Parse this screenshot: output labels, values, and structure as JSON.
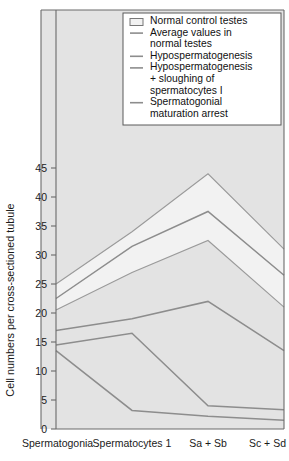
{
  "chart_data": {
    "type": "line",
    "title": "",
    "xlabel": "",
    "ylabel": "Cell numbers per cross-sectioned tubule",
    "categories": [
      "Spermatogonia",
      "Spermatocytes 1",
      "Sa + Sb",
      "Sc + Sd"
    ],
    "ylim": [
      0,
      48
    ],
    "yticks": [
      0,
      5,
      10,
      15,
      20,
      25,
      30,
      35,
      40,
      45
    ],
    "ytick_labels": [
      "0",
      "5",
      "10",
      "15",
      "20",
      "25",
      "30",
      "35",
      "40",
      "45"
    ],
    "grid": false,
    "legend_position": "top-right",
    "band": {
      "name": "Normal control testes",
      "upper": [
        25.0,
        34.0,
        44.0,
        31.0
      ],
      "lower": [
        20.5,
        27.0,
        32.5,
        21.0
      ],
      "fill_color": "#f2f2f2",
      "edge_color": "#9a9a9a"
    },
    "series": [
      {
        "name": "Average values in normal testes",
        "values": [
          22.5,
          31.5,
          37.5,
          26.5
        ],
        "color": "#8d8d8d"
      },
      {
        "name": "Hypospermatogenesis",
        "values": [
          17.0,
          19.0,
          22.0,
          13.5
        ],
        "color": "#8d8d8d"
      },
      {
        "name": "Hypospermatogenesis + sloughing of spermatocytes I",
        "values": [
          14.5,
          16.5,
          4.0,
          3.3
        ],
        "color": "#8d8d8d"
      },
      {
        "name": "Spermatogonial maturation arrest",
        "values": [
          13.5,
          3.2,
          2.2,
          1.5
        ],
        "color": "#8d8d8d"
      }
    ]
  },
  "legend": {
    "entries": [
      {
        "label": "Normal control testes",
        "marker": "swatch"
      },
      {
        "label": "Average values in",
        "label2": "normal testes",
        "marker": "line"
      },
      {
        "label": "Hypospermatogenesis",
        "marker": "line"
      },
      {
        "label": "Hypospermatogenesis",
        "label2": "+ sloughing of",
        "label3": "spermatocytes I",
        "marker": "line"
      },
      {
        "label": "Spermatogonial",
        "label2": "maturation arrest",
        "marker": "line"
      }
    ]
  },
  "colors": {
    "plot_background": "#e3e3e3",
    "page_background": "#ffffff",
    "band_fill": "#f2f2f2",
    "line": "#8d8d8d",
    "axis": "#6b6b6b",
    "text": "#111111",
    "legend_background": "#ffffff"
  }
}
